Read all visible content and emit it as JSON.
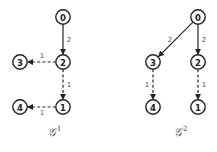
{
  "graphs": [
    {
      "id": "G1",
      "label": "𝒢",
      "superscript": "1",
      "label_pos": [
        48,
        136
      ],
      "nodes": [
        {
          "id": "0",
          "x": 63,
          "y": 17
        },
        {
          "id": "2",
          "x": 63,
          "y": 62
        },
        {
          "id": "3",
          "x": 20,
          "y": 62
        },
        {
          "id": "1",
          "x": 63,
          "y": 107
        },
        {
          "id": "4",
          "x": 20,
          "y": 107
        }
      ],
      "edges": [
        {
          "from": "0",
          "to": "2",
          "weight": "2",
          "style": "solid",
          "label_pos": [
            69,
            40
          ]
        },
        {
          "from": "2",
          "to": "3",
          "weight": "1",
          "style": "dashed",
          "label_pos": [
            42,
            56
          ]
        },
        {
          "from": "2",
          "to": "1",
          "weight": "1",
          "style": "dashed",
          "label_pos": [
            69,
            85
          ]
        },
        {
          "from": "1",
          "to": "4",
          "weight": "1",
          "style": "dashed",
          "label_pos": [
            42,
            113
          ]
        }
      ]
    },
    {
      "id": "G2",
      "label": "𝒢",
      "superscript": "2",
      "label_pos": [
        174,
        136
      ],
      "nodes": [
        {
          "id": "0",
          "x": 198,
          "y": 17
        },
        {
          "id": "3",
          "x": 153,
          "y": 62
        },
        {
          "id": "2",
          "x": 198,
          "y": 62
        },
        {
          "id": "4",
          "x": 153,
          "y": 107
        },
        {
          "id": "1",
          "x": 198,
          "y": 107
        }
      ],
      "edges": [
        {
          "from": "0",
          "to": "3",
          "weight": "2",
          "style": "solid",
          "label_pos": [
            170,
            40
          ]
        },
        {
          "from": "0",
          "to": "2",
          "weight": "2",
          "style": "solid",
          "label_pos": [
            204,
            40
          ]
        },
        {
          "from": "3",
          "to": "4",
          "weight": "1",
          "style": "dashed",
          "label_pos": [
            147,
            85
          ]
        },
        {
          "from": "2",
          "to": "1",
          "weight": "1",
          "style": "dashed",
          "label_pos": [
            204,
            85
          ]
        }
      ]
    }
  ],
  "colors": {
    "stroke": "#222222",
    "edge_label": "#555555",
    "background": "#ffffff"
  }
}
